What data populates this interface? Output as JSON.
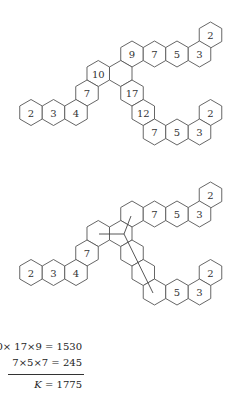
{
  "colors": {
    "background": "#ffffff",
    "hex_stroke": "#555555",
    "text": "#333333",
    "line": "#444444"
  },
  "hex_radius": 13,
  "diagrams": [
    {
      "name": "labeled-tree",
      "offset_y": 0,
      "hexes": [
        {
          "cx": 210.5,
          "cy": 35,
          "label": "2"
        },
        {
          "cx": 132,
          "cy": 54,
          "label": "9"
        },
        {
          "cx": 154.5,
          "cy": 54,
          "label": "7"
        },
        {
          "cx": 177,
          "cy": 54,
          "label": "5"
        },
        {
          "cx": 199.5,
          "cy": 54,
          "label": "3"
        },
        {
          "cx": 98.25,
          "cy": 73.5,
          "label": "10"
        },
        {
          "cx": 120.75,
          "cy": 73.5,
          "label": ""
        },
        {
          "cx": 87,
          "cy": 93,
          "label": "7"
        },
        {
          "cx": 132,
          "cy": 93,
          "label": "17"
        },
        {
          "cx": 31,
          "cy": 112.5,
          "label": "2"
        },
        {
          "cx": 53.5,
          "cy": 112.5,
          "label": "3"
        },
        {
          "cx": 76,
          "cy": 112.5,
          "label": "4"
        },
        {
          "cx": 143.25,
          "cy": 112.5,
          "label": "12"
        },
        {
          "cx": 210.5,
          "cy": 112.5,
          "label": "2"
        },
        {
          "cx": 154.5,
          "cy": 132,
          "label": "7"
        },
        {
          "cx": 177,
          "cy": 132,
          "label": "5"
        },
        {
          "cx": 199.5,
          "cy": 132,
          "label": "3"
        }
      ],
      "lines": []
    },
    {
      "name": "cut-tree",
      "offset_y": 160,
      "hexes": [
        {
          "cx": 210.5,
          "cy": 35,
          "label": "2"
        },
        {
          "cx": 132,
          "cy": 54,
          "label": ""
        },
        {
          "cx": 154.5,
          "cy": 54,
          "label": "7"
        },
        {
          "cx": 177,
          "cy": 54,
          "label": "5"
        },
        {
          "cx": 199.5,
          "cy": 54,
          "label": "3"
        },
        {
          "cx": 98.25,
          "cy": 73.5,
          "label": ""
        },
        {
          "cx": 120.75,
          "cy": 73.5,
          "label": ""
        },
        {
          "cx": 87,
          "cy": 93,
          "label": "7"
        },
        {
          "cx": 132,
          "cy": 93,
          "label": ""
        },
        {
          "cx": 31,
          "cy": 112.5,
          "label": "2"
        },
        {
          "cx": 53.5,
          "cy": 112.5,
          "label": "3"
        },
        {
          "cx": 76,
          "cy": 112.5,
          "label": "4"
        },
        {
          "cx": 143.25,
          "cy": 112.5,
          "label": ""
        },
        {
          "cx": 210.5,
          "cy": 112.5,
          "label": "2"
        },
        {
          "cx": 154.5,
          "cy": 132,
          "label": ""
        },
        {
          "cx": 177,
          "cy": 132,
          "label": "5"
        },
        {
          "cx": 199.5,
          "cy": 132,
          "label": "3"
        }
      ],
      "lines": [
        {
          "x1": 99,
          "y1": 74,
          "x2": 124,
          "y2": 74
        },
        {
          "x1": 124,
          "y1": 74,
          "x2": 131,
          "y2": 56
        },
        {
          "x1": 124,
          "y1": 74,
          "x2": 153,
          "y2": 133
        }
      ]
    }
  ],
  "equations": {
    "line1": "10× 17×9 = 1530",
    "line2": "7×5×7 = 245",
    "result_var": "K",
    "result_rest": " = 1775"
  }
}
